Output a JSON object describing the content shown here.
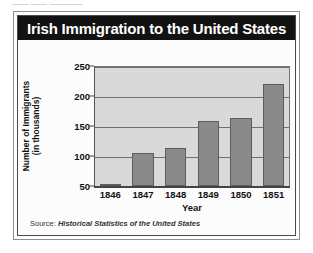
{
  "page": {
    "cropped_top_text": "—— —— ————"
  },
  "card": {
    "title": "Irish Immigration to the United States",
    "source_prefix": "Source:",
    "source_work": "Historical Statistics of the United States"
  },
  "colors": {
    "title_band": "#121212",
    "title_text": "#ffffff",
    "bar_fill": "#8a8a8a",
    "bar_stroke": "#5d5d5d",
    "plot_background": "#d9d9d9",
    "gridline": "#6f6f6f",
    "card_background": "#fdfdfd"
  },
  "chart_data": {
    "type": "bar",
    "title": "Irish Immigration to the United States",
    "xlabel": "Year",
    "ylabel": "Number of Immigrants (in thousands)",
    "ylabel_line1": "Number of Immigrants",
    "ylabel_line2": "(in thousands)",
    "categories": [
      "1846",
      "1847",
      "1848",
      "1849",
      "1850",
      "1851"
    ],
    "values": [
      51,
      105,
      113,
      159,
      164,
      220
    ],
    "ylim": [
      50,
      250
    ],
    "yticks": [
      50,
      100,
      150,
      200,
      250
    ],
    "ytick_labels": [
      "50",
      "100",
      "150",
      "200",
      "250"
    ],
    "grid": true,
    "grid_axis": "y",
    "legend": false,
    "units": "thousands of immigrants",
    "note": "y-axis is truncated; bars are measured from a baseline of 50"
  }
}
